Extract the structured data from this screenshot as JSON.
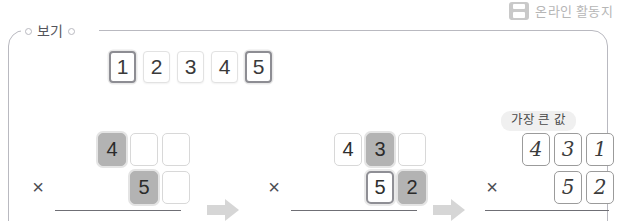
{
  "top_badge": {
    "icon": "printer-icon",
    "label": "온라인 활동지"
  },
  "panel": {
    "legend_label": "보기"
  },
  "number_cards": [
    {
      "value": "1",
      "selected": true
    },
    {
      "value": "2",
      "selected": false
    },
    {
      "value": "3",
      "selected": false
    },
    {
      "value": "4",
      "selected": false
    },
    {
      "value": "5",
      "selected": true
    }
  ],
  "groups": [
    {
      "label": "",
      "operator": "×",
      "top_row": [
        {
          "value": "4",
          "style": "filled"
        },
        {
          "value": "",
          "style": "blank"
        },
        {
          "value": "",
          "style": "blank"
        }
      ],
      "bottom_row": [
        {
          "value": "5",
          "style": "filled"
        },
        {
          "value": "",
          "style": "blank"
        }
      ],
      "answers": [
        "53",
        "43"
      ]
    },
    {
      "label": "",
      "operator": "×",
      "top_row": [
        {
          "value": "4",
          "style": "plain"
        },
        {
          "value": "3",
          "style": "filled"
        },
        {
          "value": "",
          "style": "blank"
        }
      ],
      "bottom_row": [
        {
          "value": "5",
          "style": "outlined"
        },
        {
          "value": "2",
          "style": "filled"
        }
      ],
      "answers": [
        "420",
        "430"
      ]
    },
    {
      "label": "가장 큰 값",
      "operator": "×",
      "top_row": [
        {
          "value": "4",
          "style": "hand"
        },
        {
          "value": "3",
          "style": "hand"
        },
        {
          "value": "1",
          "style": "hand"
        }
      ],
      "bottom_row": [
        {
          "value": "5",
          "style": "hand"
        },
        {
          "value": "2",
          "style": "hand"
        }
      ],
      "answers": [
        "22412"
      ]
    }
  ],
  "arrows": [
    {
      "name": "flow-arrow-1"
    },
    {
      "name": "flow-arrow-2"
    }
  ]
}
